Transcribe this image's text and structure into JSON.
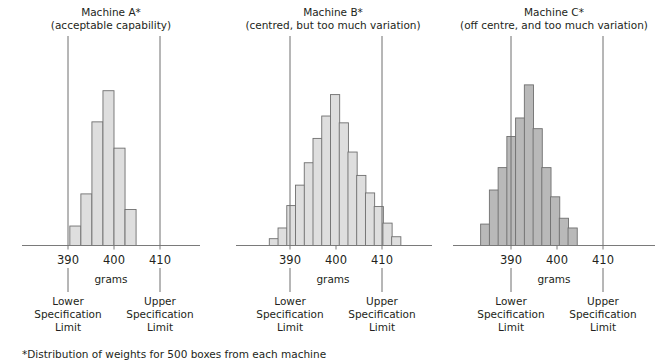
{
  "figure": {
    "footnote": "*Distribution of weights for 500 boxes from each machine",
    "axis_label": "grams",
    "lower_limit_lines": [
      "Lower",
      "Specification",
      "Limit"
    ],
    "upper_limit_lines": [
      "Upper",
      "Specification",
      "Limit"
    ],
    "tick_labels": [
      "390",
      "400",
      "410"
    ],
    "colors": {
      "bar_light_fill": "#dedede",
      "bar_dark_fill": "#b9b9b9",
      "bar_stroke": "#6f6f6f",
      "axis": "#7a7a7a",
      "spec_line": "#6f6f6f",
      "text": "#231f20",
      "background": "#ffffff"
    }
  },
  "panels": [
    {
      "id": "machine-a",
      "title": "Machine A*",
      "subtitle": "(acceptable capability)",
      "lower_spec": 390,
      "upper_spec": 410
    },
    {
      "id": "machine-b",
      "title": "Machine B*",
      "subtitle": "(centred, but too much variation)",
      "lower_spec": 390,
      "upper_spec": 410
    },
    {
      "id": "machine-c",
      "title": "Machine C*",
      "subtitle": "(off centre, and too much variation)",
      "lower_spec": 390,
      "upper_spec": 410
    }
  ],
  "chart_data": [
    {
      "type": "bar",
      "title": "Machine A*",
      "subtitle": "(acceptable capability)",
      "xlabel": "grams",
      "ylabel": "",
      "grid": false,
      "legend": "none",
      "xlim": [
        384,
        416
      ],
      "ylim": [
        0,
        170
      ],
      "xticks": [
        390,
        400,
        410
      ],
      "bin_width": 2.4,
      "bin_left_edges": [
        390.4,
        392.8,
        395.2,
        397.6,
        400.0,
        402.4
      ],
      "categories": [
        "390-392",
        "392-395",
        "395-398",
        "398-400",
        "400-402",
        "402-405"
      ],
      "values": [
        20,
        53,
        127,
        159,
        100,
        37
      ],
      "annotations": [
        "Lower Specification Limit at 390",
        "Upper Specification Limit at 410"
      ]
    },
    {
      "type": "bar",
      "title": "Machine B*",
      "subtitle": "(centred, but too much variation)",
      "xlabel": "grams",
      "ylabel": "",
      "grid": false,
      "legend": "none",
      "xlim": [
        384,
        416
      ],
      "ylim": [
        0,
        170
      ],
      "xticks": [
        390,
        400,
        410
      ],
      "bin_width": 2.0,
      "bin_left_edges": [
        385.5,
        387.4,
        389.3,
        391.2,
        393.1,
        395.0,
        396.9,
        398.8,
        400.7,
        402.6,
        404.5,
        406.4,
        408.3,
        410.2,
        412.1
      ],
      "categories": [
        "386",
        "388",
        "390",
        "391",
        "393",
        "395",
        "397",
        "399",
        "401",
        "403",
        "405",
        "407",
        "409",
        "411",
        "413"
      ],
      "values": [
        7,
        18,
        41,
        62,
        85,
        110,
        133,
        155,
        126,
        96,
        72,
        54,
        40,
        23,
        9
      ],
      "annotations": [
        "Lower Specification Limit at 390",
        "Upper Specification Limit at 410"
      ]
    },
    {
      "type": "bar",
      "title": "Machine C*",
      "subtitle": "(off centre, and too much variation)",
      "xlabel": "grams",
      "ylabel": "",
      "grid": false,
      "legend": "none",
      "xlim": [
        384,
        416
      ],
      "ylim": [
        0,
        170
      ],
      "xticks": [
        390,
        400,
        410
      ],
      "bin_width": 2.0,
      "bin_left_edges": [
        383.4,
        385.3,
        387.2,
        389.1,
        391.0,
        392.9,
        394.8,
        396.7,
        398.6,
        400.5,
        402.4
      ],
      "categories": [
        "384",
        "386",
        "388",
        "389",
        "391",
        "393",
        "395",
        "397",
        "399",
        "401",
        "403"
      ],
      "values": [
        22,
        57,
        80,
        112,
        131,
        165,
        120,
        80,
        50,
        28,
        18
      ],
      "annotations": [
        "Lower Specification Limit at 390",
        "Upper Specification Limit at 410"
      ]
    }
  ]
}
